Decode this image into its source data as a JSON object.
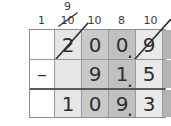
{
  "worksheet": {
    "type": "vertical-subtraction-with-regrouping",
    "operator": "–",
    "decimal_point": ".",
    "regrouping": {
      "marks": [
        {
          "value": "1",
          "struck": false,
          "carry_above": ""
        },
        {
          "value": "10",
          "struck": true,
          "carry_above": "9"
        },
        {
          "value": "10",
          "struck": false,
          "carry_above": ""
        },
        {
          "value": "8",
          "struck": false,
          "carry_above": ""
        },
        {
          "value": "10",
          "struck": false,
          "carry_above": ""
        }
      ]
    },
    "rows": [
      {
        "name": "minuend",
        "operator": "",
        "cells": [
          {
            "value": "2",
            "struck": true,
            "decimal_after": false
          },
          {
            "value": "0",
            "struck": false,
            "decimal_after": false
          },
          {
            "value": "0",
            "struck": false,
            "decimal_after": true
          },
          {
            "value": "9",
            "struck": true,
            "decimal_after": false
          },
          {
            "value": "0",
            "struck": false,
            "decimal_after": false
          }
        ]
      },
      {
        "name": "subtrahend",
        "operator": "–",
        "cells": [
          {
            "value": "",
            "struck": false,
            "decimal_after": false
          },
          {
            "value": "9",
            "struck": false,
            "decimal_after": false
          },
          {
            "value": "1",
            "struck": false,
            "decimal_after": true
          },
          {
            "value": "5",
            "struck": false,
            "decimal_after": false
          },
          {
            "value": "2",
            "struck": false,
            "decimal_after": false
          }
        ]
      },
      {
        "name": "difference",
        "operator": "",
        "cells": [
          {
            "value": "1",
            "struck": false,
            "decimal_after": false
          },
          {
            "value": "0",
            "struck": false,
            "decimal_after": false
          },
          {
            "value": "9",
            "struck": false,
            "decimal_after": true
          },
          {
            "value": "3",
            "struck": false,
            "decimal_after": false
          },
          {
            "value": "8",
            "struck": false,
            "decimal_after": false
          }
        ]
      }
    ],
    "colors": {
      "ink": "#2f2f2f",
      "grid_line": "#9a9a9a",
      "answer_rule": "#5a5a5a",
      "col_shades": [
        "#ffffff",
        "#e6e6e6",
        "#c9c9c9",
        "#c0c0c0",
        "#e9e9e9",
        "#b4b4b4"
      ]
    }
  }
}
